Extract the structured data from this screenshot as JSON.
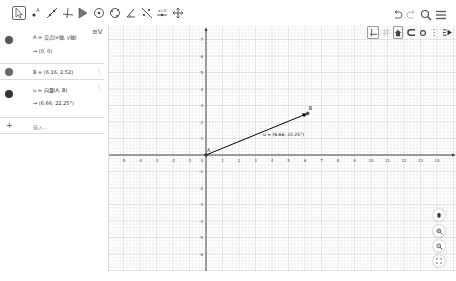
{
  "toolbar": {
    "tools": [
      {
        "name": "move-tool",
        "icon": "cursor-arrow-icon",
        "active": true
      },
      {
        "name": "point-tool",
        "icon": "point-icon"
      },
      {
        "name": "line-tool",
        "icon": "line-icon"
      },
      {
        "name": "perpendicular-tool",
        "icon": "perpendicular-icon"
      },
      {
        "name": "polygon-tool",
        "icon": "polygon-icon"
      },
      {
        "name": "circle-tool",
        "icon": "circle-center-icon"
      },
      {
        "name": "conic-tool",
        "icon": "ellipse-icon"
      },
      {
        "name": "angle-tool",
        "icon": "angle-icon"
      },
      {
        "name": "reflect-tool",
        "icon": "reflect-icon"
      },
      {
        "name": "slider-tool",
        "icon": "slider-icon"
      },
      {
        "name": "move-graphics-tool",
        "icon": "move-graphics-icon"
      }
    ],
    "right": [
      {
        "name": "undo-button",
        "icon": "undo-icon"
      },
      {
        "name": "redo-button",
        "icon": "redo-icon"
      },
      {
        "name": "search-button",
        "icon": "search-icon"
      },
      {
        "name": "menu-button",
        "icon": "hamburger-menu-icon"
      }
    ]
  },
  "algebra": {
    "view_toggle_icon": "≡V",
    "items": [
      {
        "line1": "A = 交点(x轴, y轴)",
        "line2": "→  (0, 0)",
        "dot_color": "#555555"
      },
      {
        "line1": "B = (6.16, 2.52)",
        "dot_color": "#666666"
      },
      {
        "line1": "u = 向量(A, B)",
        "line2": "→  (6.66; 22.25°)",
        "dot_color": "#333333"
      }
    ],
    "input_placeholder": "输入...",
    "add_icon": "+"
  },
  "graphics": {
    "style_bar": [
      "axes-grid-toggle",
      "grid-toggle",
      "home-toggle",
      "point-capture",
      "dot-style",
      "more",
      "style-bar-toggle"
    ],
    "x_ticks": [
      -5,
      -4,
      -3,
      -2,
      -1,
      0,
      1,
      2,
      3,
      4,
      5,
      6,
      7,
      8,
      9,
      10,
      11,
      12,
      13,
      14
    ],
    "y_ticks": [
      7,
      6,
      5,
      4,
      3,
      2,
      1,
      -1,
      -2,
      -3,
      -4,
      -5,
      -6
    ],
    "point_A": {
      "label": "A",
      "x": 0,
      "y": 0
    },
    "point_B": {
      "label": "B",
      "x": 6.16,
      "y": 2.52
    },
    "vector_label": "u = (6.66; 22.25°)",
    "axis_color": "#333333",
    "vector_color": "#000000",
    "zoom_buttons": [
      "home",
      "zoom-in",
      "zoom-out",
      "fullscreen"
    ]
  }
}
